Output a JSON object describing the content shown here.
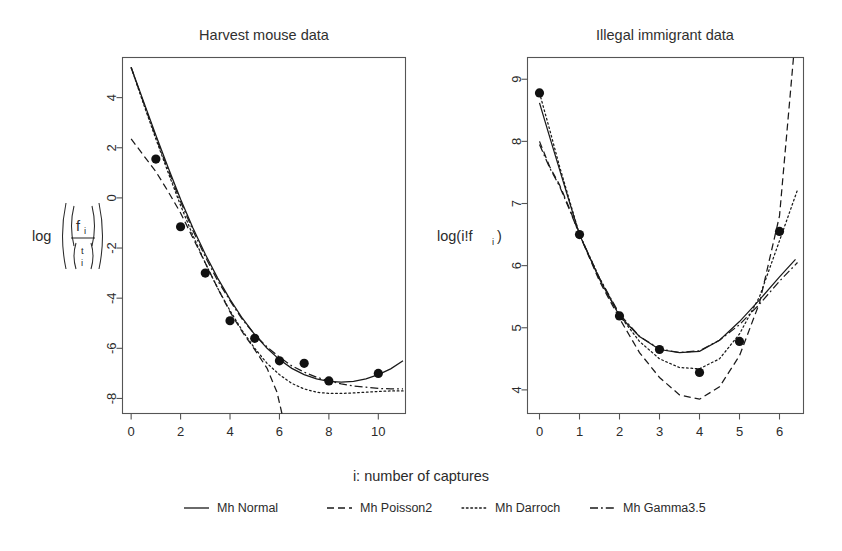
{
  "figure": {
    "width": 842,
    "height": 551,
    "background": "#ffffff",
    "ink": "#1a1a1a",
    "xlabel": "i: number of captures"
  },
  "legend": {
    "position": "bottom-center",
    "entries": [
      {
        "label": "Mh Normal",
        "style": "solid",
        "dash": "none",
        "key": "normal"
      },
      {
        "label": "Mh Poisson2",
        "style": "dashed",
        "dash": "7,4",
        "key": "poisson2"
      },
      {
        "label": "Mh Darroch",
        "style": "dotted",
        "dash": "1.6,2.6",
        "key": "darroch"
      },
      {
        "label": "Mh Gamma3.5",
        "style": "dashdot",
        "dash": "8,3,1.8,3",
        "key": "gamma35"
      }
    ]
  },
  "chart_data": [
    {
      "type": "scatter",
      "id": "harvest-mouse",
      "title": "Harvest mouse data",
      "xlabel": "i: number of captures",
      "ylabel": "log(f_i / (t choose i))",
      "ylabel_parts": {
        "log": "log",
        "numerator": "f",
        "numerator_sub": "i",
        "denom_top": "t",
        "denom_bottom": "i"
      },
      "xlim": [
        -0.35,
        11.1
      ],
      "ylim": [
        -8.6,
        5.6
      ],
      "xticks": [
        0,
        2,
        4,
        6,
        8,
        10
      ],
      "yticks": [
        4,
        2,
        0,
        -2,
        -4,
        -6,
        -8
      ],
      "grid": false,
      "points": {
        "x": [
          1,
          2,
          3,
          4,
          5,
          6,
          7,
          8,
          10
        ],
        "y": [
          1.55,
          -1.15,
          -3.0,
          -4.9,
          -5.6,
          -6.5,
          -6.6,
          -7.3,
          -7.0
        ]
      },
      "series": [
        {
          "name": "Mh Normal",
          "style": "solid",
          "x": [
            0,
            0.5,
            1,
            1.5,
            2,
            2.5,
            3,
            3.5,
            4,
            4.5,
            5,
            5.5,
            6,
            6.5,
            7,
            7.5,
            8,
            8.5,
            9,
            9.5,
            10,
            10.5,
            11
          ],
          "y": [
            5.2,
            3.85,
            2.5,
            1.2,
            -0.05,
            -1.2,
            -2.25,
            -3.2,
            -4.05,
            -4.8,
            -5.45,
            -6.0,
            -6.45,
            -6.8,
            -7.05,
            -7.22,
            -7.32,
            -7.35,
            -7.32,
            -7.22,
            -7.05,
            -6.82,
            -6.5
          ]
        },
        {
          "name": "Mh Poisson2",
          "style": "dashed",
          "x": [
            0,
            0.5,
            1,
            1.5,
            2,
            2.5,
            3,
            3.5,
            4,
            4.5,
            5,
            5.5,
            5.9,
            6.1
          ],
          "y": [
            2.35,
            1.7,
            1.05,
            0.25,
            -0.6,
            -1.6,
            -2.6,
            -3.6,
            -4.55,
            -5.35,
            -6.05,
            -6.8,
            -7.75,
            -8.6
          ]
        },
        {
          "name": "Mh Darroch",
          "style": "dotted",
          "x": [
            0,
            0.5,
            1,
            1.5,
            2,
            2.5,
            3,
            3.5,
            4,
            4.5,
            5,
            5.5,
            6,
            6.5,
            7,
            7.5,
            8,
            8.5,
            9,
            9.5,
            10,
            10.5,
            11
          ],
          "y": [
            5.2,
            3.75,
            2.35,
            1.0,
            -0.3,
            -1.5,
            -2.6,
            -3.6,
            -4.5,
            -5.3,
            -6.0,
            -6.6,
            -7.05,
            -7.4,
            -7.62,
            -7.75,
            -7.8,
            -7.8,
            -7.78,
            -7.75,
            -7.72,
            -7.7,
            -7.7
          ]
        },
        {
          "name": "Mh Gamma3.5",
          "style": "dashdot",
          "x": [
            0,
            0.5,
            1,
            1.5,
            2,
            2.5,
            3,
            3.5,
            4,
            4.5,
            5,
            5.5,
            6,
            6.5,
            7,
            7.5,
            8,
            8.5,
            9,
            9.5,
            10,
            10.5,
            11
          ],
          "y": [
            5.2,
            3.8,
            2.42,
            1.1,
            -0.15,
            -1.3,
            -2.35,
            -3.3,
            -4.1,
            -4.85,
            -5.45,
            -5.95,
            -6.35,
            -6.7,
            -6.95,
            -7.15,
            -7.3,
            -7.42,
            -7.5,
            -7.55,
            -7.6,
            -7.62,
            -7.62
          ]
        }
      ]
    },
    {
      "type": "scatter",
      "id": "illegal-immigrant",
      "title": "Illegal immigrant data",
      "xlabel": "i: number of captures",
      "ylabel": "log(i!f_i)",
      "ylabel_parts": {
        "prefix": "log(i!f",
        "sub": "i",
        "suffix": ")"
      },
      "xlim": [
        -0.3,
        6.6
      ],
      "ylim": [
        3.62,
        9.35
      ],
      "xticks": [
        0,
        1,
        2,
        3,
        4,
        5,
        6
      ],
      "yticks": [
        9,
        8,
        7,
        6,
        5,
        4
      ],
      "grid": false,
      "points": {
        "x": [
          0,
          1,
          2,
          3,
          4,
          5,
          6
        ],
        "y": [
          8.78,
          6.5,
          5.19,
          4.65,
          4.28,
          4.78,
          6.55
        ]
      },
      "series": [
        {
          "name": "Mh Normal",
          "style": "solid",
          "x": [
            0,
            0.25,
            0.5,
            0.75,
            1,
            1.5,
            2,
            2.5,
            3,
            3.5,
            4,
            4.5,
            5,
            5.5,
            6,
            6.4
          ],
          "y": [
            8.62,
            8.08,
            7.55,
            7.02,
            6.5,
            5.78,
            5.19,
            4.86,
            4.65,
            4.6,
            4.62,
            4.8,
            5.1,
            5.45,
            5.82,
            6.1
          ]
        },
        {
          "name": "Mh Poisson2",
          "style": "dashed",
          "x": [
            0,
            0.25,
            0.5,
            0.75,
            1,
            1.5,
            2,
            2.5,
            3,
            3.5,
            4,
            4.5,
            5,
            5.5,
            6,
            6.35
          ],
          "y": [
            8.0,
            7.6,
            7.3,
            6.92,
            6.5,
            5.75,
            5.15,
            4.6,
            4.2,
            3.92,
            3.85,
            4.05,
            4.55,
            5.4,
            6.8,
            9.35
          ]
        },
        {
          "name": "Mh Darroch",
          "style": "dotted",
          "x": [
            0,
            0.25,
            0.5,
            0.75,
            1,
            1.5,
            2,
            2.5,
            3,
            3.5,
            4,
            4.5,
            5,
            5.5,
            6,
            6.45
          ],
          "y": [
            8.78,
            8.2,
            7.6,
            7.05,
            6.5,
            5.8,
            5.2,
            4.78,
            4.5,
            4.36,
            4.34,
            4.5,
            4.9,
            5.5,
            6.4,
            7.22
          ]
        },
        {
          "name": "Mh Gamma3.5",
          "style": "dashdot",
          "x": [
            0,
            0.25,
            0.5,
            0.75,
            1,
            1.5,
            2,
            2.5,
            3,
            3.5,
            4,
            4.5,
            5,
            5.5,
            6,
            6.45
          ],
          "y": [
            7.95,
            7.58,
            7.28,
            6.9,
            6.5,
            5.8,
            5.22,
            4.86,
            4.66,
            4.6,
            4.63,
            4.8,
            5.05,
            5.38,
            5.75,
            6.05
          ]
        }
      ]
    }
  ]
}
